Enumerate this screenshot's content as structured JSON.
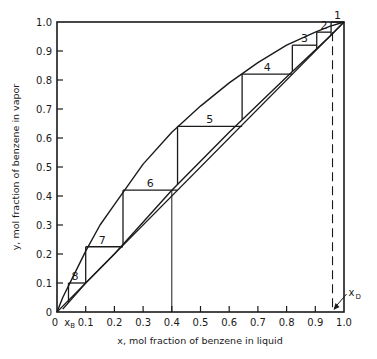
{
  "chart_data": {
    "type": "line",
    "title": "",
    "xlabel": "x, mol fraction of benzene in liquid",
    "ylabel": "y, mol fraction of benzene in vapor",
    "xlim": [
      0,
      1.0
    ],
    "ylim": [
      0,
      1.0
    ],
    "grid": false,
    "x_ticks": [
      "0",
      "0.1",
      "0.2",
      "0.3",
      "0.4",
      "0.5",
      "0.6",
      "0.7",
      "0.8",
      "0.9",
      "1.0"
    ],
    "y_ticks": [
      "0",
      "0.1",
      "0.2",
      "0.3",
      "0.4",
      "0.5",
      "0.6",
      "0.7",
      "0.8",
      "0.9",
      "1.0"
    ],
    "series": [
      {
        "name": "Equilibrium curve",
        "x": [
          0,
          0.02,
          0.05,
          0.1,
          0.15,
          0.2,
          0.25,
          0.3,
          0.4,
          0.5,
          0.6,
          0.7,
          0.8,
          0.9,
          0.95,
          1.0
        ],
        "y": [
          0,
          0.05,
          0.11,
          0.21,
          0.3,
          0.37,
          0.44,
          0.51,
          0.62,
          0.71,
          0.79,
          0.86,
          0.92,
          0.965,
          0.985,
          1.0
        ]
      },
      {
        "name": "Operating line",
        "x": [
          0.02,
          0.1,
          0.2,
          0.4,
          0.6,
          0.8,
          0.95,
          1.0
        ],
        "y": [
          0.01,
          0.1,
          0.2,
          0.42,
          0.62,
          0.81,
          0.95,
          1.0
        ]
      },
      {
        "name": "Diagonal y = x",
        "x": [
          0,
          1.0
        ],
        "y": [
          0,
          1.0
        ]
      }
    ],
    "stages": [
      {
        "label": "1",
        "x_from": 1.0,
        "y": 1.0,
        "x_to": 0.955
      },
      {
        "label": "2",
        "x_from": 0.955,
        "y": 0.965,
        "x_to": 0.905
      },
      {
        "label": "3",
        "x_from": 0.905,
        "y": 0.92,
        "x_to": 0.82
      },
      {
        "label": "4",
        "x_from": 0.82,
        "y": 0.82,
        "x_to": 0.645
      },
      {
        "label": "5",
        "x_from": 0.645,
        "y": 0.64,
        "x_to": 0.42
      },
      {
        "label": "6",
        "x_from": 0.42,
        "y": 0.42,
        "x_to": 0.23
      },
      {
        "label": "7",
        "x_from": 0.23,
        "y": 0.225,
        "x_to": 0.1
      },
      {
        "label": "8",
        "x_from": 0.1,
        "y": 0.1,
        "x_to": 0.04
      }
    ],
    "annotations": [
      {
        "text": "x_B",
        "x": 0.02,
        "note": "bottoms composition marker"
      },
      {
        "text": "x_D",
        "x": 0.96,
        "note": "distillate composition, dashed vertical line with arrow"
      },
      {
        "text": "feed line",
        "x": 0.4,
        "note": "vertical line at x = 0.4"
      }
    ]
  },
  "labels": {
    "x_axis_title": "x, mol fraction of benzene in liquid",
    "y_axis_title": "y, mol fraction of benzene in vapor",
    "xb": "x",
    "xb_sub": "B",
    "xd": "x",
    "xd_sub": "D"
  }
}
